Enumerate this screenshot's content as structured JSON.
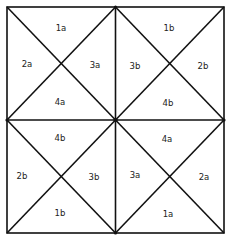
{
  "diagram": {
    "line_color": "#111111",
    "background": "#ffffff",
    "bounds": {
      "left": 7,
      "top": 7,
      "right": 224,
      "bottom": 233
    },
    "squares": [
      {
        "position": "top-left",
        "labels": {
          "top": "1a",
          "left": "2a",
          "right": "3a",
          "bottom": "4a"
        }
      },
      {
        "position": "top-right",
        "labels": {
          "top": "1b",
          "left": "3b",
          "right": "2b",
          "bottom": "4b"
        }
      },
      {
        "position": "bottom-left",
        "labels": {
          "top": "4b",
          "left": "2b",
          "right": "3b",
          "bottom": "1b"
        }
      },
      {
        "position": "bottom-right",
        "labels": {
          "top": "4a",
          "left": "3a",
          "right": "2a",
          "bottom": "1a"
        }
      }
    ]
  }
}
